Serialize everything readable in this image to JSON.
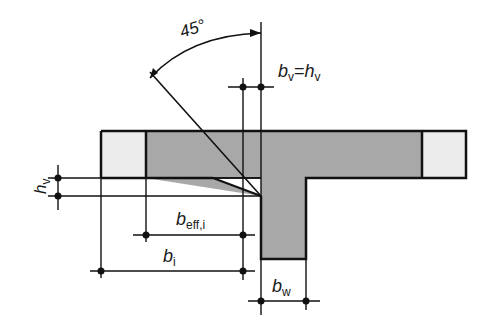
{
  "diagram": {
    "labels": {
      "angle": "45°",
      "bv_eq_hv_b": "b",
      "bv_eq_hv_bsub": "v",
      "bv_eq_hv_eq": "=",
      "bv_eq_hv_h": "h",
      "bv_eq_hv_hsub": "v",
      "hv_h": "h",
      "hv_sub": "v",
      "beff_b": "b",
      "beff_sub": "eff,i",
      "bi_b": "b",
      "bi_sub": "i",
      "bw_b": "b",
      "bw_sub": "w"
    },
    "colors": {
      "section_fill": "#a8a8a8",
      "haunch_fill": "#ececec",
      "line": "#111111"
    }
  }
}
